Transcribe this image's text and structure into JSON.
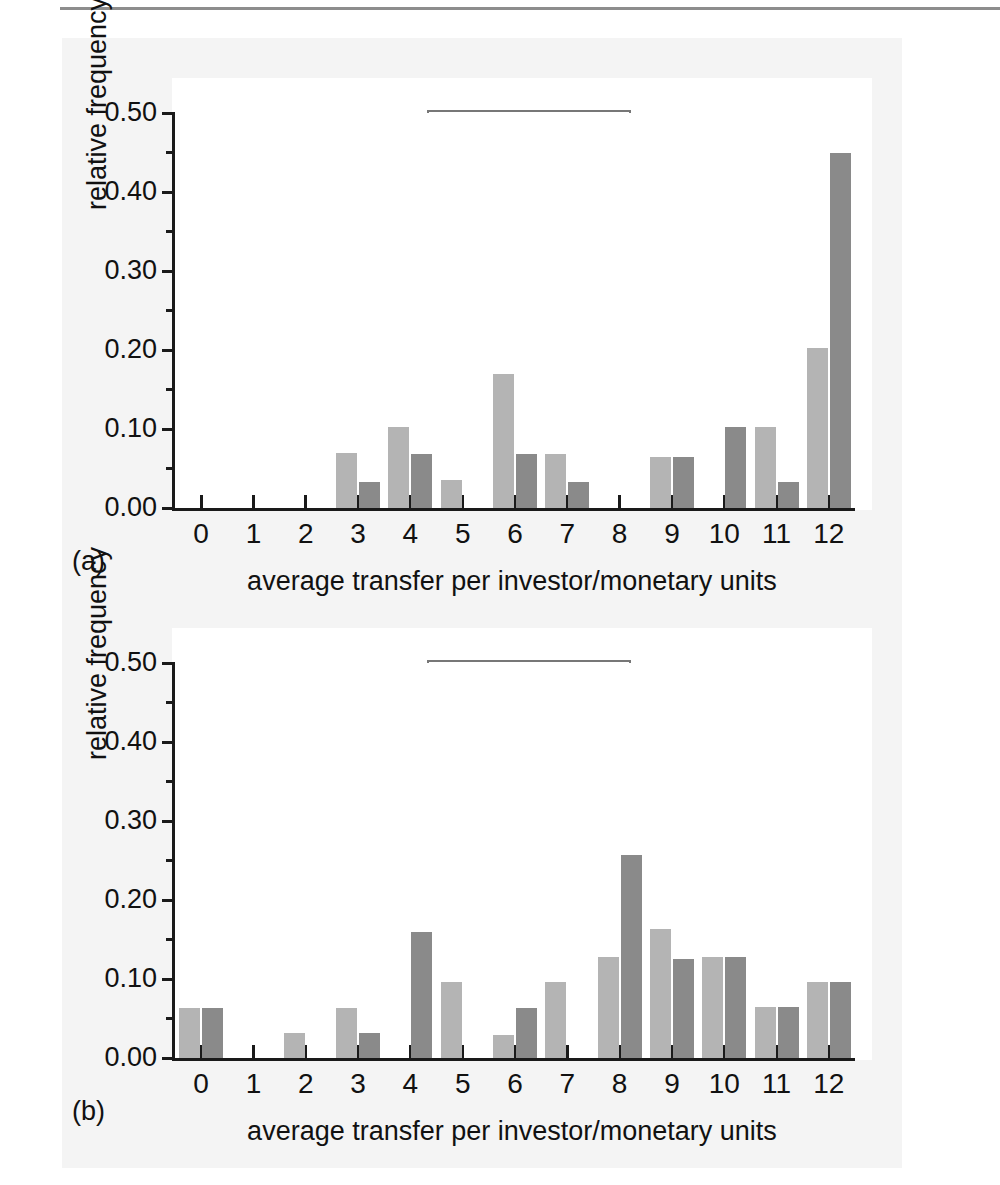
{
  "figure": {
    "background_color": "#f4f4f4",
    "bar_colors": {
      "oxytocin": "#8a8a8a",
      "placebo": "#b4b4b4"
    }
  },
  "panels": [
    {
      "tag": "(a)",
      "experiment_title": "trust experiment",
      "legend": {
        "oxytocin": "oxytocin",
        "placebo": "placebo"
      }
    },
    {
      "tag": "(b)",
      "experiment_title": "risk experiment",
      "legend": {
        "oxytocin": "oxytocin",
        "placebo": "placebo"
      }
    }
  ],
  "chart_data": [
    {
      "type": "bar",
      "title": "trust experiment",
      "panel": "(a)",
      "xlabel": "average transfer per investor/monetary units",
      "ylabel": "relative frequency",
      "categories": [
        "0",
        "1",
        "2",
        "3",
        "4",
        "5",
        "6",
        "7",
        "8",
        "9",
        "10",
        "11",
        "12"
      ],
      "series": [
        {
          "name": "placebo",
          "color": "#b4b4b4",
          "values": [
            0,
            0,
            0,
            0.07,
            0.102,
            0.035,
            0.17,
            0.068,
            0,
            0.065,
            0,
            0.102,
            0.203
          ]
        },
        {
          "name": "oxytocin",
          "color": "#8a8a8a",
          "values": [
            0,
            0,
            0,
            0.033,
            0.068,
            0,
            0.068,
            0.033,
            0,
            0.065,
            0.102,
            0.033,
            0.45
          ]
        }
      ],
      "ylim": [
        0.0,
        0.5
      ],
      "ytick_labels": [
        "0.00",
        "0.10",
        "0.20",
        "0.30",
        "0.40",
        "0.50"
      ],
      "ytick_values": [
        0.0,
        0.1,
        0.2,
        0.3,
        0.4,
        0.5
      ],
      "yminor_values": [
        0.05,
        0.15,
        0.25,
        0.35,
        0.45
      ],
      "xlim": [
        -0.5,
        12.5
      ],
      "grid": false,
      "legend_position": "top-center"
    },
    {
      "type": "bar",
      "title": "risk experiment",
      "panel": "(b)",
      "xlabel": "average transfer per investor/monetary units",
      "ylabel": "relative frequency",
      "categories": [
        "0",
        "1",
        "2",
        "3",
        "4",
        "5",
        "6",
        "7",
        "8",
        "9",
        "10",
        "11",
        "12"
      ],
      "series": [
        {
          "name": "placebo",
          "color": "#b4b4b4",
          "values": [
            0.063,
            0,
            0.032,
            0.063,
            0,
            0.096,
            0.029,
            0.096,
            0.128,
            0.163,
            0.128,
            0.064,
            0.096
          ]
        },
        {
          "name": "oxytocin",
          "color": "#8a8a8a",
          "values": [
            0.063,
            0,
            0,
            0.032,
            0.16,
            0,
            0.063,
            0,
            0.257,
            0.125,
            0.128,
            0.064,
            0.096
          ]
        }
      ],
      "ylim": [
        0.0,
        0.5
      ],
      "ytick_labels": [
        "0.00",
        "0.10",
        "0.20",
        "0.30",
        "0.40",
        "0.50"
      ],
      "ytick_values": [
        0.0,
        0.1,
        0.2,
        0.3,
        0.4,
        0.5
      ],
      "yminor_values": [
        0.05,
        0.15,
        0.25,
        0.35,
        0.45
      ],
      "xlim": [
        -0.5,
        12.5
      ],
      "grid": false,
      "legend_position": "top-center"
    }
  ]
}
